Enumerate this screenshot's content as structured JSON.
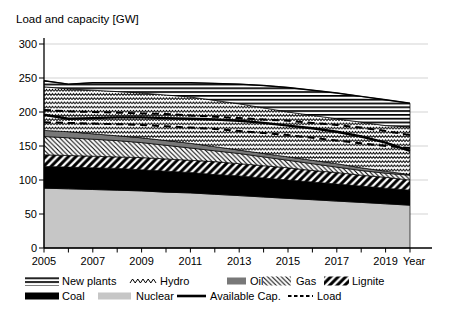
{
  "title": "Load and capacity [GW]",
  "chart_data": {
    "type": "area",
    "stacked": true,
    "title": "Load and capacity [GW]",
    "xlabel": "Year",
    "ylabel": "",
    "x_years": [
      2005,
      2006,
      2007,
      2008,
      2009,
      2010,
      2011,
      2012,
      2013,
      2014,
      2015,
      2016,
      2017,
      2018,
      2019,
      2020
    ],
    "xtick_labels": [
      "2005",
      "2007",
      "2009",
      "2011",
      "2013",
      "2015",
      "2017",
      "2019"
    ],
    "ylim": [
      0,
      300
    ],
    "ytick_step": 50,
    "ytick_labels": [
      "0",
      "50",
      "100",
      "150",
      "200",
      "250",
      "300"
    ],
    "grid": true,
    "grid_color": "#c8c8c8",
    "colors": {
      "nuclear": "#c6c6c6",
      "coal": "#000000",
      "oil": "#787878",
      "pattern_ink": "#000000",
      "background": "#ffffff"
    },
    "series": [
      {
        "name": "Nuclear",
        "pattern": "solid-lightgray",
        "values": [
          88,
          87,
          86,
          85,
          84,
          82,
          81,
          79,
          77,
          75,
          73,
          71,
          69,
          67,
          65,
          63
        ]
      },
      {
        "name": "Coal",
        "pattern": "solid-black",
        "values": [
          32,
          32,
          32,
          32,
          31,
          31,
          30,
          29,
          29,
          28,
          27,
          26,
          25,
          24,
          23,
          22
        ]
      },
      {
        "name": "Lignite",
        "pattern": "bold-forward-diagonal",
        "values": [
          17,
          17,
          17,
          17,
          18,
          18,
          18,
          19,
          18,
          18,
          18,
          17,
          17,
          16,
          16,
          15
        ]
      },
      {
        "name": "Gas",
        "pattern": "thin-back-diagonal",
        "values": [
          27,
          26,
          25,
          24,
          22,
          20,
          18,
          16,
          15,
          13,
          11,
          10,
          8,
          7,
          6,
          7
        ]
      },
      {
        "name": "Oil",
        "pattern": "solid-darkgray",
        "values": [
          9,
          9,
          8,
          7,
          7,
          7,
          7,
          6,
          5,
          5,
          5,
          5,
          5,
          4,
          3,
          1
        ]
      },
      {
        "name": "Hydro",
        "pattern": "chevron-zigzag",
        "values": [
          64,
          63,
          64,
          65,
          66,
          67,
          68,
          68,
          68,
          67,
          66,
          66,
          66,
          67,
          67,
          70
        ]
      },
      {
        "name": "New plants",
        "pattern": "horizontal-lines",
        "values": [
          9,
          7,
          11,
          13,
          15,
          18,
          21,
          25,
          29,
          33,
          36,
          37,
          38,
          38,
          38,
          35
        ]
      }
    ],
    "lines": [
      {
        "name": "Available Cap.",
        "style": "solid",
        "values": [
          196,
          190,
          191,
          192,
          192,
          191,
          190,
          189,
          187,
          184,
          180,
          176,
          171,
          164,
          155,
          143
        ]
      },
      {
        "name": "Load",
        "style": "dashed",
        "values_upper": [
          203,
          201,
          200,
          199,
          198,
          197,
          195,
          193,
          191,
          189,
          187,
          184,
          181,
          177,
          172,
          166
        ],
        "values_lower": [
          185,
          184,
          183,
          182,
          181,
          179,
          177,
          175,
          172,
          169,
          166,
          162,
          158,
          154,
          150,
          147
        ]
      }
    ],
    "legend": {
      "rows": [
        [
          {
            "label": "New plants",
            "key": "horizontal-lines"
          },
          {
            "label": "Hydro",
            "key": "chevron-zigzag"
          },
          {
            "label": "Oil",
            "key": "solid-darkgray"
          },
          {
            "label": "Gas",
            "key": "thin-back-diagonal"
          },
          {
            "label": "Lignite",
            "key": "bold-forward-diagonal"
          }
        ],
        [
          {
            "label": "Coal",
            "key": "solid-black"
          },
          {
            "label": "Nuclear",
            "key": "solid-lightgray"
          },
          {
            "label": "Available Cap.",
            "key": "line-solid"
          },
          {
            "label": "Load",
            "key": "line-dashed"
          }
        ]
      ]
    }
  }
}
